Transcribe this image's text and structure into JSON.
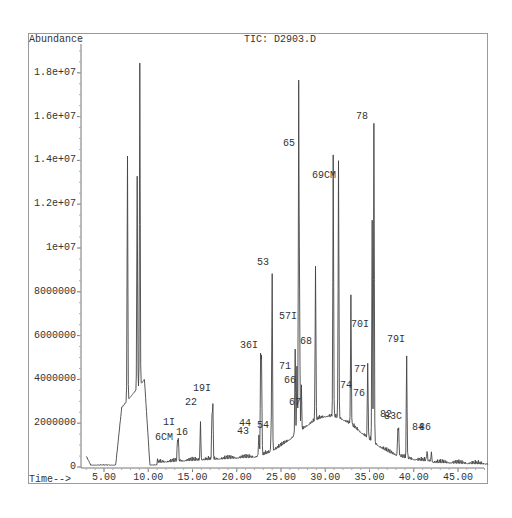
{
  "chart_data": {
    "type": "line",
    "title": "TIC: D2903.D",
    "xlabel": "Time-->",
    "ylabel": "Abundance",
    "xlim": [
      3.0,
      48.5
    ],
    "ylim": [
      0,
      19500000
    ],
    "x_ticks": [
      "5.00",
      "10.00",
      "15.00",
      "20.00",
      "25.00",
      "30.00",
      "35.00",
      "40.00",
      "45.00"
    ],
    "y_ticks": [
      "0",
      "2000000",
      "4000000",
      "6000000",
      "8000000",
      "1e+07",
      "1.2e+07",
      "1.4e+07",
      "1.6e+07",
      "1.8e+07"
    ],
    "grid": false,
    "legend": null,
    "peaks": [
      {
        "label": "",
        "rt": 7.65,
        "abundance": 11400000
      },
      {
        "label": "",
        "rt": 8.75,
        "abundance": 9900000
      },
      {
        "label": "",
        "rt": 9.05,
        "abundance": 15000000
      },
      {
        "label": "6CM",
        "rt": 13.3,
        "abundance": 900000
      },
      {
        "label": "1I",
        "rt": 13.4,
        "abundance": 1000000
      },
      {
        "label": "16",
        "rt": 15.9,
        "abundance": 1800000
      },
      {
        "label": "22",
        "rt": 17.2,
        "abundance": 2000000
      },
      {
        "label": "19I",
        "rt": 17.3,
        "abundance": 2400000
      },
      {
        "label": "43",
        "rt": 22.5,
        "abundance": 1000000
      },
      {
        "label": "44",
        "rt": 22.7,
        "abundance": 4400000
      },
      {
        "label": "36I",
        "rt": 22.8,
        "abundance": 4400000
      },
      {
        "label": "54",
        "rt": 23.9,
        "abundance": 1200000
      },
      {
        "label": "53",
        "rt": 24.0,
        "abundance": 8200000
      },
      {
        "label": "71",
        "rt": 26.6,
        "abundance": 3900000
      },
      {
        "label": "66",
        "rt": 26.8,
        "abundance": 3000000
      },
      {
        "label": "65",
        "rt": 27.0,
        "abundance": 16000000
      },
      {
        "label": "57I",
        "rt": 27.1,
        "abundance": 5700000
      },
      {
        "label": "67",
        "rt": 27.3,
        "abundance": 2000000
      },
      {
        "label": "68",
        "rt": 28.9,
        "abundance": 7200000
      },
      {
        "label": "69CM",
        "rt": 30.9,
        "abundance": 12200000
      },
      {
        "label": "",
        "rt": 31.5,
        "abundance": 12000000
      },
      {
        "label": "74",
        "rt": 32.9,
        "abundance": 5900000
      },
      {
        "label": "76",
        "rt": 34.8,
        "abundance": 3500000
      },
      {
        "label": "70I",
        "rt": 35.3,
        "abundance": 5400000
      },
      {
        "label": "77",
        "rt": 35.3,
        "abundance": 4800000
      },
      {
        "label": "78",
        "rt": 35.5,
        "abundance": 14900000
      },
      {
        "label": "82",
        "rt": 38.2,
        "abundance": 1200000
      },
      {
        "label": "83C",
        "rt": 38.3,
        "abundance": 1200000
      },
      {
        "label": "79I",
        "rt": 39.2,
        "abundance": 4700000
      },
      {
        "label": "84",
        "rt": 41.5,
        "abundance": 450000
      },
      {
        "label": "86",
        "rt": 42.0,
        "abundance": 450000
      }
    ],
    "annotations": [
      "1I",
      "6CM",
      "16",
      "22",
      "19I",
      "43",
      "44",
      "36I",
      "54",
      "53",
      "71",
      "66",
      "67",
      "57I",
      "68",
      "65",
      "69CM",
      "74",
      "76",
      "77",
      "70I",
      "78",
      "82",
      "83C",
      "79I",
      "84",
      "86"
    ]
  },
  "labels": {
    "abundance": "Abundance",
    "title": "TIC: D2903.D",
    "time": "Time-->"
  }
}
